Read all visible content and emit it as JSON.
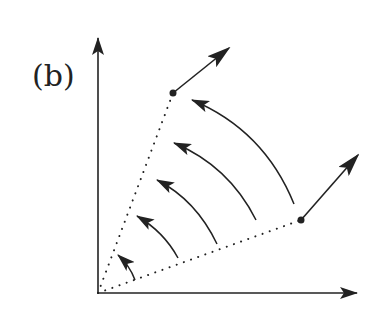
{
  "figure": {
    "panel_label": "(b)",
    "colors": {
      "ink": "#222222",
      "background": "#ffffff"
    },
    "axes": {
      "origin": [
        98,
        293
      ],
      "y_axis_tip": [
        98,
        38
      ],
      "x_axis_tip": [
        357,
        293
      ]
    },
    "rays": [
      {
        "name": "upper-ray",
        "end": [
          173,
          93
        ],
        "style": "dotted"
      },
      {
        "name": "lower-ray",
        "end": [
          301,
          220
        ],
        "style": "dotted"
      }
    ],
    "vectors": [
      {
        "name": "upper-vector",
        "from": [
          173,
          93
        ],
        "to": [
          229,
          48
        ]
      },
      {
        "name": "lower-vector",
        "from": [
          301,
          220
        ],
        "to": [
          358,
          155
        ]
      }
    ],
    "arcs": [
      {
        "from": [
          135,
          280
        ],
        "ctrl": [
          130,
          266
        ],
        "to": [
          118,
          255
        ]
      },
      {
        "from": [
          178,
          258
        ],
        "ctrl": [
          164,
          232
        ],
        "to": [
          137,
          216
        ]
      },
      {
        "from": [
          217,
          244
        ],
        "ctrl": [
          196,
          200
        ],
        "to": [
          157,
          180
        ]
      },
      {
        "from": [
          256,
          220
        ],
        "ctrl": [
          229,
          166
        ],
        "to": [
          174,
          143
        ]
      },
      {
        "from": [
          294,
          204
        ],
        "ctrl": [
          264,
          130
        ],
        "to": [
          192,
          100
        ]
      }
    ]
  }
}
